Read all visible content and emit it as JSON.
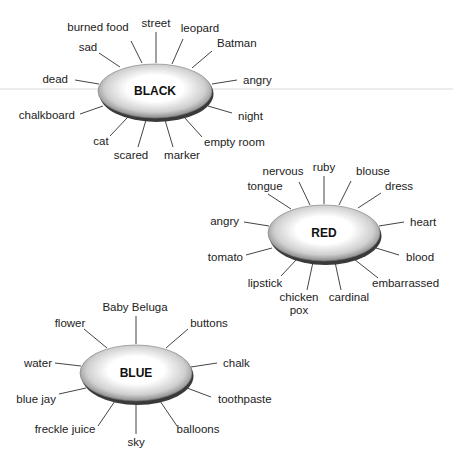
{
  "diagram": {
    "type": "word-association-webs",
    "clusters": [
      {
        "id": "black",
        "center_label": "BLACK",
        "cx": 155,
        "cy": 91,
        "rx": 57,
        "ry": 28,
        "associations": [
          {
            "label": "burned food",
            "x": 98,
            "y": 31,
            "anchor": "middle",
            "sx": 131,
            "sy": 41,
            "ex": 142,
            "ey": 63
          },
          {
            "label": "street",
            "x": 156,
            "y": 27,
            "anchor": "middle",
            "sx": 156,
            "sy": 32,
            "ex": 156,
            "ey": 63
          },
          {
            "label": "leopard",
            "x": 200,
            "y": 32,
            "anchor": "middle",
            "sx": 183,
            "sy": 39,
            "ex": 172,
            "ey": 64
          },
          {
            "label": "sad",
            "x": 88,
            "y": 51,
            "anchor": "middle",
            "sx": 99,
            "sy": 53,
            "ex": 120,
            "ey": 67
          },
          {
            "label": "Batman",
            "x": 217,
            "y": 47,
            "anchor": "start",
            "sx": 212,
            "sy": 51,
            "ex": 192,
            "ey": 68
          },
          {
            "label": "dead",
            "x": 68,
            "y": 83,
            "anchor": "end",
            "sx": 75,
            "sy": 80,
            "ex": 99,
            "ey": 84
          },
          {
            "label": "angry",
            "x": 243,
            "y": 84,
            "anchor": "start",
            "sx": 237,
            "sy": 80,
            "ex": 212,
            "ey": 84
          },
          {
            "label": "chalkboard",
            "x": 75,
            "y": 119,
            "anchor": "end",
            "sx": 80,
            "sy": 114,
            "ex": 103,
            "ey": 106
          },
          {
            "label": "night",
            "x": 238,
            "y": 120,
            "anchor": "start",
            "sx": 232,
            "sy": 113,
            "ex": 208,
            "ey": 106
          },
          {
            "label": "cat",
            "x": 101,
            "y": 145,
            "anchor": "middle",
            "sx": 110,
            "sy": 136,
            "ex": 128,
            "ey": 117
          },
          {
            "label": "empty room",
            "x": 204,
            "y": 146,
            "anchor": "start",
            "sx": 202,
            "sy": 137,
            "ex": 184,
            "ey": 117
          },
          {
            "label": "scared",
            "x": 131,
            "y": 159,
            "anchor": "middle",
            "sx": 138,
            "sy": 147,
            "ex": 146,
            "ey": 120
          },
          {
            "label": "marker",
            "x": 182,
            "y": 159,
            "anchor": "middle",
            "sx": 173,
            "sy": 147,
            "ex": 165,
            "ey": 120
          }
        ]
      },
      {
        "id": "red",
        "center_label": "RED",
        "cx": 324,
        "cy": 233,
        "rx": 56,
        "ry": 29,
        "associations": [
          {
            "label": "ruby",
            "x": 324,
            "y": 171,
            "anchor": "middle",
            "sx": 324,
            "sy": 176,
            "ex": 324,
            "ey": 204
          },
          {
            "label": "nervous",
            "x": 283,
            "y": 175,
            "anchor": "middle",
            "sx": 299,
            "sy": 182,
            "ex": 310,
            "ey": 205
          },
          {
            "label": "blouse",
            "x": 373,
            "y": 175,
            "anchor": "middle",
            "sx": 351,
            "sy": 181,
            "ex": 339,
            "ey": 205
          },
          {
            "label": "tongue",
            "x": 265,
            "y": 190,
            "anchor": "middle",
            "sx": 268,
            "sy": 194,
            "ex": 291,
            "ey": 209
          },
          {
            "label": "dress",
            "x": 385,
            "y": 190,
            "anchor": "start",
            "sx": 381,
            "sy": 193,
            "ex": 358,
            "ey": 208
          },
          {
            "label": "angry",
            "x": 239,
            "y": 225,
            "anchor": "end",
            "sx": 244,
            "sy": 222,
            "ex": 269,
            "ey": 226
          },
          {
            "label": "heart",
            "x": 410,
            "y": 226,
            "anchor": "start",
            "sx": 404,
            "sy": 222,
            "ex": 379,
            "ey": 226
          },
          {
            "label": "tomato",
            "x": 243,
            "y": 261,
            "anchor": "end",
            "sx": 246,
            "sy": 255,
            "ex": 272,
            "ey": 248
          },
          {
            "label": "blood",
            "x": 406,
            "y": 261,
            "anchor": "start",
            "sx": 399,
            "sy": 255,
            "ex": 376,
            "ey": 248
          },
          {
            "label": "lipstick",
            "x": 265,
            "y": 287,
            "anchor": "middle",
            "sx": 281,
            "sy": 276,
            "ex": 297,
            "ey": 259
          },
          {
            "label": "embarrassed",
            "x": 372,
            "y": 287,
            "anchor": "start",
            "sx": 378,
            "sy": 278,
            "ex": 354,
            "ey": 259
          },
          {
            "label": "chicken",
            "x": 299,
            "y": 301,
            "anchor": "middle",
            "sx": 307,
            "sy": 290,
            "ex": 313,
            "ey": 262
          },
          {
            "label": "pox",
            "x": 299,
            "y": 314,
            "anchor": "middle",
            "sx": null,
            "sy": null,
            "ex": null,
            "ey": null
          },
          {
            "label": "cardinal",
            "x": 349,
            "y": 301,
            "anchor": "middle",
            "sx": 341,
            "sy": 290,
            "ex": 335,
            "ey": 262
          }
        ]
      },
      {
        "id": "blue",
        "center_label": "BLUE",
        "cx": 136,
        "cy": 373,
        "rx": 56,
        "ry": 29,
        "associations": [
          {
            "label": "Baby Beluga",
            "x": 135,
            "y": 311,
            "anchor": "middle",
            "sx": 136,
            "sy": 316,
            "ex": 136,
            "ey": 344
          },
          {
            "label": "flower",
            "x": 70,
            "y": 327,
            "anchor": "middle",
            "sx": 84,
            "sy": 329,
            "ex": 107,
            "ey": 348
          },
          {
            "label": "buttons",
            "x": 209,
            "y": 327,
            "anchor": "middle",
            "sx": 188,
            "sy": 329,
            "ex": 166,
            "ey": 348
          },
          {
            "label": "water",
            "x": 52,
            "y": 367,
            "anchor": "end",
            "sx": 55,
            "sy": 363,
            "ex": 81,
            "ey": 366
          },
          {
            "label": "chalk",
            "x": 223,
            "y": 367,
            "anchor": "start",
            "sx": 217,
            "sy": 363,
            "ex": 191,
            "ey": 367
          },
          {
            "label": "blue jay",
            "x": 56,
            "y": 403,
            "anchor": "end",
            "sx": 59,
            "sy": 394,
            "ex": 86,
            "ey": 388
          },
          {
            "label": "toothpaste",
            "x": 218,
            "y": 403,
            "anchor": "start",
            "sx": 211,
            "sy": 397,
            "ex": 187,
            "ey": 388
          },
          {
            "label": "freckle juice",
            "x": 65,
            "y": 433,
            "anchor": "middle",
            "sx": 98,
            "sy": 426,
            "ex": 115,
            "ey": 401
          },
          {
            "label": "balloons",
            "x": 198,
            "y": 433,
            "anchor": "middle",
            "sx": 177,
            "sy": 426,
            "ex": 160,
            "ey": 401
          },
          {
            "label": "sky",
            "x": 136,
            "y": 446,
            "anchor": "middle",
            "sx": 136,
            "sy": 434,
            "ex": 136,
            "ey": 403
          }
        ]
      }
    ],
    "colors": {
      "ellipse_center": "#ffffff",
      "ellipse_edge": "#8a8a8a",
      "ellipse_shadow": "#3a3a3a",
      "spoke": "#444444",
      "text": "#222222",
      "background": "#ffffff",
      "faint_rule": "#e6e6e6"
    },
    "faint_rule": {
      "x1": 0,
      "y1": 89,
      "x2": 453,
      "y2": 89
    }
  }
}
